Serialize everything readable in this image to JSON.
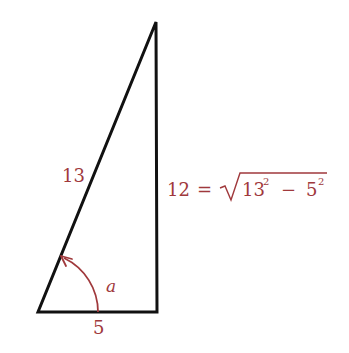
{
  "diagram": {
    "type": "right-triangle",
    "colors": {
      "edges": "#111111",
      "labels": "#a0393c",
      "arc": "#a0393c"
    },
    "vertices": {
      "bottom_left": [
        38,
        312
      ],
      "bottom_right": [
        157,
        312
      ],
      "top": [
        156,
        22
      ]
    },
    "labels": {
      "hypotenuse": "13",
      "base": "5",
      "height_value": "12",
      "height_equals": "=",
      "radicand_a": "13",
      "radicand_a_exp": "2",
      "minus": "−",
      "radicand_b": "5",
      "radicand_b_exp": "2",
      "angle": "a"
    }
  }
}
